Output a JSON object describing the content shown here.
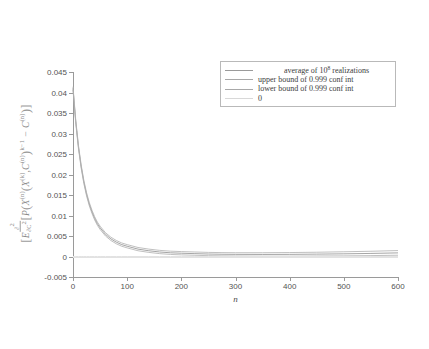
{
  "chart_data": {
    "type": "line",
    "title": "",
    "xlabel": "n",
    "ylabel_math": "E[ (∂²/∂C²) P( X^(n)( X^(k), C^(n) )^(k-1) − C^(n) ) ]",
    "xlim": [
      0,
      600
    ],
    "ylim": [
      -0.005,
      0.045
    ],
    "xticks": [
      0,
      100,
      200,
      300,
      400,
      500,
      600
    ],
    "xtick_labels": [
      "0",
      "100",
      "200",
      "300",
      "400",
      "500",
      "600"
    ],
    "yticks": [
      -0.005,
      0,
      0.005,
      0.01,
      0.015,
      0.02,
      0.025,
      0.03,
      0.035,
      0.04,
      0.045
    ],
    "ytick_labels": [
      "-0.005",
      "0",
      "0.005",
      "0.01",
      "0.015",
      "0.02",
      "0.025",
      "0.03",
      "0.035",
      "0.04",
      "0.045"
    ],
    "grid": false,
    "legend_position": "upper right",
    "legend": [
      {
        "label": "average of 10",
        "label_sup": "8",
        "label_tail": " realizations",
        "color": "#9a9a9a"
      },
      {
        "label": "upper bound of 0.999 conf int",
        "color": "#a8a8a8"
      },
      {
        "label": "lower bound of 0.999 conf int",
        "color": "#a8a8a8"
      },
      {
        "label": "0",
        "color": "#d8d8d8"
      }
    ],
    "x": [
      0,
      5,
      10,
      15,
      20,
      25,
      30,
      35,
      40,
      45,
      50,
      60,
      70,
      80,
      90,
      100,
      120,
      140,
      160,
      180,
      200,
      225,
      250,
      275,
      300,
      350,
      400,
      450,
      500,
      550,
      600
    ],
    "series": [
      {
        "name": "average of 10^8 realizations",
        "color": "#8e8e8e",
        "values": [
          0.041,
          0.033,
          0.0268,
          0.022,
          0.0182,
          0.0152,
          0.0128,
          0.0109,
          0.0093,
          0.008,
          0.007,
          0.0054,
          0.0043,
          0.0035,
          0.0029,
          0.0025,
          0.0018,
          0.0014,
          0.0011,
          0.0009,
          0.0008,
          0.0007,
          0.0006,
          0.00055,
          0.00052,
          0.0005,
          0.00052,
          0.00058,
          0.00065,
          0.00075,
          0.00088
        ]
      },
      {
        "name": "upper bound of 0.999 conf int",
        "color": "#b0b0b0",
        "values": [
          0.0414,
          0.0334,
          0.0272,
          0.0224,
          0.0186,
          0.0156,
          0.0132,
          0.0113,
          0.0097,
          0.0084,
          0.0074,
          0.0058,
          0.0047,
          0.0039,
          0.0033,
          0.0029,
          0.0022,
          0.0018,
          0.0015,
          0.0013,
          0.0012,
          0.0011,
          0.001,
          0.00095,
          0.00092,
          0.00092,
          0.00096,
          0.00104,
          0.00115,
          0.00128,
          0.00145
        ]
      },
      {
        "name": "lower bound of 0.999 conf int",
        "color": "#b0b0b0",
        "values": [
          0.0406,
          0.0326,
          0.0264,
          0.0216,
          0.0178,
          0.0148,
          0.0124,
          0.0105,
          0.0089,
          0.0076,
          0.0066,
          0.005,
          0.0039,
          0.0031,
          0.0025,
          0.0021,
          0.0014,
          0.001,
          0.0007,
          0.0005,
          0.0004,
          0.0003,
          0.0002,
          0.00015,
          0.00012,
          8e-05,
          8e-05,
          0.00012,
          0.00015,
          0.00022,
          0.00031
        ]
      },
      {
        "name": "0",
        "color": "#e2e2e2",
        "values": [
          0,
          0,
          0,
          0,
          0,
          0,
          0,
          0,
          0,
          0,
          0,
          0,
          0,
          0,
          0,
          0,
          0,
          0,
          0,
          0,
          0,
          0,
          0,
          0,
          0,
          0,
          0,
          0,
          0,
          0,
          0
        ]
      }
    ]
  }
}
